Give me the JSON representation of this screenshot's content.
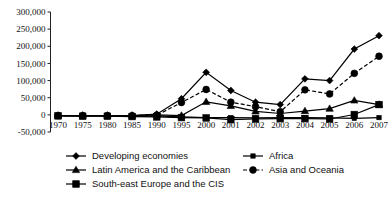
{
  "chart_data": {
    "type": "line",
    "title": "",
    "subtitle": "",
    "xlabel": "",
    "ylabel": "",
    "grid": false,
    "legend_position": "bottom",
    "categories": [
      "1970",
      "1975",
      "1980",
      "1985",
      "1990",
      "1995",
      "2000",
      "2001",
      "2002",
      "2003",
      "2004",
      "2005",
      "2006",
      "2007"
    ],
    "xtick_labels": [
      "1970",
      "1975",
      "1980",
      "1985",
      "1990",
      "1995",
      "2000",
      "2001",
      "2002",
      "2003",
      "2004",
      "2005",
      "2006",
      "2007"
    ],
    "ytick_labels": [
      "300,000",
      "250,000",
      "200,000",
      "150,000",
      "100,000",
      "50,000",
      "0",
      "-50,000"
    ],
    "ytick_values": [
      300000,
      250000,
      200000,
      150000,
      100000,
      50000,
      0,
      -50000
    ],
    "ylim": [
      -50000,
      300000
    ],
    "series": [
      {
        "name": "Developing economies",
        "marker": "diamond",
        "linestyle": "solid",
        "color": "#000000",
        "values": [
          -2000,
          -2000,
          -2000,
          -2000,
          2000,
          47000,
          124000,
          71000,
          37000,
          30000,
          105000,
          100000,
          192000,
          231000
        ]
      },
      {
        "name": "Africa",
        "marker": "square-small",
        "linestyle": "solid",
        "color": "#000000",
        "values": [
          -2000,
          -3000,
          -3000,
          -4000,
          -3000,
          -6000,
          -8000,
          -8000,
          -9000,
          -8000,
          -8000,
          -9000,
          -10000,
          -8000
        ]
      },
      {
        "name": "Latin America and the Caribbean",
        "marker": "triangle",
        "linestyle": "solid",
        "color": "#000000",
        "values": [
          -2000,
          -2000,
          -2000,
          -2000,
          0,
          -2000,
          38000,
          26000,
          10000,
          4000,
          11000,
          18000,
          42000,
          30000
        ]
      },
      {
        "name": "Asia and Oceania",
        "marker": "circle",
        "linestyle": "dashed",
        "color": "#000000",
        "values": [
          -2000,
          -2000,
          -2000,
          -2000,
          -1000,
          36000,
          74000,
          37000,
          24000,
          9000,
          73000,
          61000,
          121000,
          171000
        ]
      },
      {
        "name": "South-east Europe and the CIS",
        "marker": "square",
        "linestyle": "solid",
        "color": "#000000",
        "values": [
          -3000,
          -4000,
          -4000,
          -5000,
          -6000,
          -8000,
          -9000,
          -14000,
          -12000,
          -11000,
          -11000,
          -12000,
          1000,
          30000
        ]
      }
    ]
  },
  "legend": {
    "items": [
      {
        "label": "Developing economies",
        "marker": "diamond",
        "linestyle": "solid"
      },
      {
        "label": "Africa",
        "marker": "square-small",
        "linestyle": "solid"
      },
      {
        "label": "Latin America and the Caribbean",
        "marker": "triangle",
        "linestyle": "solid"
      },
      {
        "label": "Asia and Oceania",
        "marker": "circle",
        "linestyle": "dashed"
      },
      {
        "label": "South-east Europe and the CIS",
        "marker": "square",
        "linestyle": "solid"
      }
    ]
  }
}
